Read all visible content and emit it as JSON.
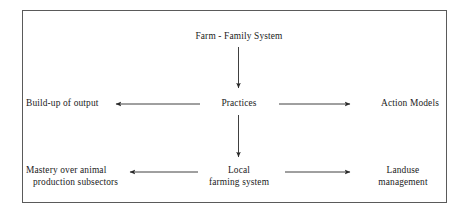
{
  "diagram": {
    "frame": {
      "stroke_color": "#5a5a5a"
    },
    "text_color": "#1b1b1b",
    "arrow_color": "#2a2a2a",
    "nodes": {
      "farm_family_system": {
        "label": "Farm - Family System"
      },
      "practices": {
        "label": "Practices"
      },
      "build_up_of_output": {
        "label": "Build-up of output"
      },
      "action_models": {
        "label": "Action Models"
      },
      "local_farming_system": {
        "line1": "Local",
        "line2": "farming system"
      },
      "mastery_animal_production": {
        "line1": "Mastery over animal",
        "line2": "production subsectors"
      },
      "landuse_management": {
        "line1": "Landuse",
        "line2": "management"
      }
    },
    "arrows": [
      {
        "name": "arrow-farm-to-practices",
        "from": "farm_family_system",
        "to": "practices",
        "direction": "down"
      },
      {
        "name": "arrow-practices-to-build-up",
        "from": "practices",
        "to": "build_up_of_output",
        "direction": "left"
      },
      {
        "name": "arrow-practices-to-action-models",
        "from": "practices",
        "to": "action_models",
        "direction": "right"
      },
      {
        "name": "arrow-practices-to-local-farming",
        "from": "practices",
        "to": "local_farming_system",
        "direction": "down"
      },
      {
        "name": "arrow-local-farming-to-mastery",
        "from": "local_farming_system",
        "to": "mastery_animal_production",
        "direction": "left"
      },
      {
        "name": "arrow-local-farming-to-landuse",
        "from": "local_farming_system",
        "to": "landuse_management",
        "direction": "right"
      }
    ]
  }
}
